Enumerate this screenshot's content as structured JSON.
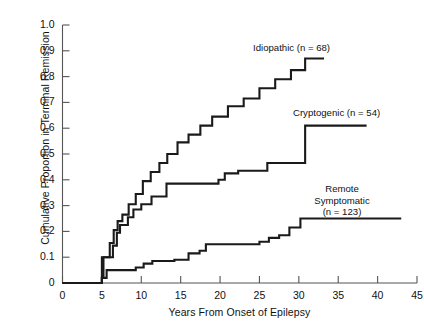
{
  "chart_data": {
    "type": "line",
    "subtype": "step",
    "title": "",
    "xlabel": "Years From Onset of Epilepsy",
    "ylabel": "Cumulative Proportion in Terminal Remission",
    "xlim": [
      0,
      45
    ],
    "ylim": [
      0,
      1.0
    ],
    "xticks": [
      0,
      5,
      10,
      15,
      20,
      25,
      30,
      35,
      40,
      45
    ],
    "xtick_labels": [
      "0",
      "5",
      "10",
      "15",
      "20",
      "25",
      "30",
      "35",
      "40",
      "45"
    ],
    "yticks": [
      0,
      0.1,
      0.2,
      0.3,
      0.4,
      0.5,
      0.6,
      0.7,
      0.8,
      0.9,
      1.0
    ],
    "ytick_labels": [
      "0",
      "0.1",
      "0.2",
      "0.3",
      "0.4",
      "0.5",
      "0.6",
      "0.7",
      "0.8",
      "0.9",
      "1.0"
    ],
    "grid": false,
    "legend_position": "inline-annotations",
    "line_color": "#1a1a1a",
    "series": [
      {
        "name": "Idiopathic",
        "n": 68,
        "label": "Idiopathic (n = 68)",
        "final_value": 0.87,
        "points": [
          [
            0,
            0
          ],
          [
            5,
            0
          ],
          [
            5,
            0.02
          ],
          [
            5.2,
            0.02
          ],
          [
            5.2,
            0.1
          ],
          [
            6.0,
            0.1
          ],
          [
            6.0,
            0.155
          ],
          [
            6.5,
            0.155
          ],
          [
            6.5,
            0.205
          ],
          [
            7.0,
            0.205
          ],
          [
            7.0,
            0.24
          ],
          [
            7.6,
            0.24
          ],
          [
            7.6,
            0.265
          ],
          [
            8.4,
            0.265
          ],
          [
            8.4,
            0.305
          ],
          [
            9.3,
            0.305
          ],
          [
            9.3,
            0.345
          ],
          [
            10.2,
            0.345
          ],
          [
            10.2,
            0.395
          ],
          [
            11.2,
            0.395
          ],
          [
            11.2,
            0.43
          ],
          [
            12.3,
            0.43
          ],
          [
            12.3,
            0.465
          ],
          [
            13.3,
            0.465
          ],
          [
            13.3,
            0.5
          ],
          [
            14.6,
            0.5
          ],
          [
            14.6,
            0.545
          ],
          [
            16.0,
            0.545
          ],
          [
            16.0,
            0.575
          ],
          [
            17.5,
            0.575
          ],
          [
            17.5,
            0.61
          ],
          [
            19.0,
            0.61
          ],
          [
            19.0,
            0.645
          ],
          [
            21.0,
            0.645
          ],
          [
            21.0,
            0.685
          ],
          [
            23.0,
            0.685
          ],
          [
            23.0,
            0.715
          ],
          [
            25.0,
            0.715
          ],
          [
            25.0,
            0.755
          ],
          [
            27.0,
            0.755
          ],
          [
            27.0,
            0.79
          ],
          [
            29.0,
            0.79
          ],
          [
            29.0,
            0.825
          ],
          [
            30.8,
            0.825
          ],
          [
            30.8,
            0.87
          ],
          [
            33.2,
            0.87
          ]
        ]
      },
      {
        "name": "Cryptogenic",
        "n": 54,
        "label": "Cryptogenic (n = 54)",
        "final_value": 0.61,
        "points": [
          [
            0,
            0
          ],
          [
            5,
            0
          ],
          [
            5,
            0.1
          ],
          [
            6.4,
            0.1
          ],
          [
            6.4,
            0.145
          ],
          [
            6.9,
            0.145
          ],
          [
            6.9,
            0.195
          ],
          [
            7.3,
            0.195
          ],
          [
            7.3,
            0.225
          ],
          [
            8.3,
            0.225
          ],
          [
            8.3,
            0.255
          ],
          [
            9.0,
            0.255
          ],
          [
            9.0,
            0.285
          ],
          [
            10.0,
            0.285
          ],
          [
            10.0,
            0.305
          ],
          [
            11.3,
            0.305
          ],
          [
            11.3,
            0.335
          ],
          [
            13.2,
            0.335
          ],
          [
            13.2,
            0.385
          ],
          [
            19.8,
            0.385
          ],
          [
            19.8,
            0.4
          ],
          [
            20.6,
            0.4
          ],
          [
            20.6,
            0.425
          ],
          [
            22.3,
            0.425
          ],
          [
            22.3,
            0.435
          ],
          [
            26.0,
            0.435
          ],
          [
            26.0,
            0.465
          ],
          [
            30.8,
            0.465
          ],
          [
            30.8,
            0.61
          ],
          [
            38.6,
            0.61
          ]
        ]
      },
      {
        "name": "Remote Symptomatic",
        "n": 123,
        "label_lines": [
          "Remote",
          "Symptomatic",
          "(n = 123)"
        ],
        "final_value": 0.25,
        "points": [
          [
            0,
            0
          ],
          [
            5,
            0
          ],
          [
            5,
            0.02
          ],
          [
            5.6,
            0.02
          ],
          [
            5.6,
            0.05
          ],
          [
            9.3,
            0.05
          ],
          [
            9.3,
            0.06
          ],
          [
            10.3,
            0.06
          ],
          [
            10.3,
            0.075
          ],
          [
            11.4,
            0.075
          ],
          [
            11.4,
            0.085
          ],
          [
            14.2,
            0.085
          ],
          [
            14.2,
            0.09
          ],
          [
            16.0,
            0.09
          ],
          [
            16.0,
            0.115
          ],
          [
            17.4,
            0.115
          ],
          [
            17.4,
            0.125
          ],
          [
            18.2,
            0.125
          ],
          [
            18.2,
            0.15
          ],
          [
            25.0,
            0.15
          ],
          [
            25.0,
            0.16
          ],
          [
            26.2,
            0.16
          ],
          [
            26.2,
            0.175
          ],
          [
            27.5,
            0.175
          ],
          [
            27.5,
            0.185
          ],
          [
            28.8,
            0.185
          ],
          [
            28.8,
            0.215
          ],
          [
            30.2,
            0.215
          ],
          [
            30.2,
            0.25
          ],
          [
            43.0,
            0.25
          ]
        ]
      }
    ]
  },
  "annotations": {
    "idiopathic_label": "Idiopathic (n = 68)",
    "cryptogenic_label": "Cryptogenic (n = 54)",
    "remote_line1": "Remote",
    "remote_line2": "Symptomatic",
    "remote_line3": "(n = 123)"
  },
  "axes": {
    "y_title": "Cumulative Proportion in Terminal Remission",
    "x_title": "Years From Onset of Epilepsy"
  }
}
